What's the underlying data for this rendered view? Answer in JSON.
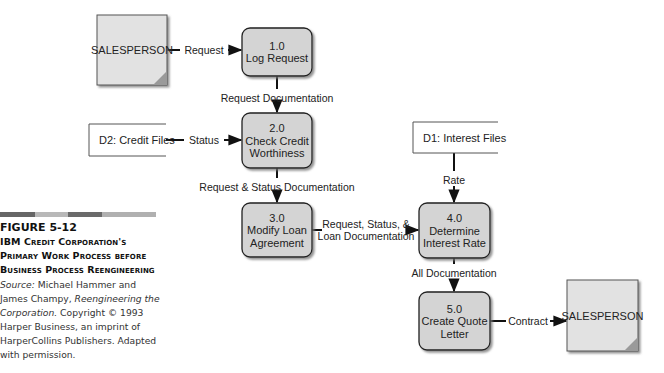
{
  "caption": {
    "bar_colors": [
      "#666666",
      "#b8b8b8",
      "#6a6a6a",
      "#b0b0b0"
    ],
    "figure_number": "FIGURE 5-12",
    "title_lines": [
      "IBM Credit Corporation's",
      "Primary Work Process before",
      "Business Process Reengineering"
    ],
    "source_label": "Source:",
    "source_authors": " Michael Hammer and James Champy, ",
    "source_book": "Reengineering the Corporation.",
    "source_rest": " Copyright © 1993 Harper Business, an imprint of HarperCollins Publishers. Adapted with permission."
  },
  "colors": {
    "process_fill": "#d4d4d4",
    "entity_fill": "#e2e2e2",
    "entity_corner": "#9a9a9a",
    "line": "#111111",
    "shadow": "#8a8a8a"
  },
  "entities": [
    {
      "id": "salesperson-source",
      "label": "SALESPERSON"
    },
    {
      "id": "salesperson-sink",
      "label": "SALESPERSON"
    }
  ],
  "data_stores": [
    {
      "id": "d2",
      "label": "D2: Credit Files"
    },
    {
      "id": "d1",
      "label": "D1: Interest Files"
    }
  ],
  "processes": [
    {
      "id": "p1",
      "number": "1.0",
      "lines": [
        "Log Request"
      ]
    },
    {
      "id": "p2",
      "number": "2.0",
      "lines": [
        "Check Credit",
        "Worthiness"
      ]
    },
    {
      "id": "p3",
      "number": "3.0",
      "lines": [
        "Modify Loan",
        "Agreement"
      ]
    },
    {
      "id": "p4",
      "number": "4.0",
      "lines": [
        "Determine",
        "Interest Rate"
      ]
    },
    {
      "id": "p5",
      "number": "5.0",
      "lines": [
        "Create Quote",
        "Letter"
      ]
    }
  ],
  "flows": [
    {
      "id": "request",
      "from": "salesperson-source",
      "to": "p1",
      "label": [
        "Request"
      ]
    },
    {
      "id": "request-doc",
      "from": "p1",
      "to": "p2",
      "label": [
        "Request Documentation"
      ]
    },
    {
      "id": "status",
      "from": "d2",
      "to": "p2",
      "label": [
        "Status"
      ]
    },
    {
      "id": "req-status-doc",
      "from": "p2",
      "to": "p3",
      "label": [
        "Request & Status Documentation"
      ]
    },
    {
      "id": "req-status-loan",
      "from": "p3",
      "to": "p4",
      "label": [
        "Request, Status, &",
        "Loan Documentation"
      ]
    },
    {
      "id": "rate",
      "from": "d1",
      "to": "p4",
      "label": [
        "Rate"
      ]
    },
    {
      "id": "all-doc",
      "from": "p4",
      "to": "p5",
      "label": [
        "All Documentation"
      ]
    },
    {
      "id": "contract",
      "from": "p5",
      "to": "salesperson-sink",
      "label": [
        "Contract"
      ]
    }
  ]
}
